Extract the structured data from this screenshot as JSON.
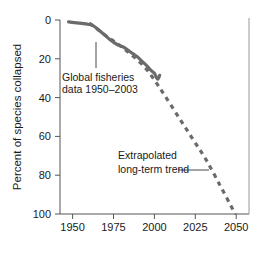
{
  "figure": {
    "background": "#ffffff",
    "line_color": "#6b6b6b",
    "axis_color": "#555555",
    "text_color": "#1a1a1a"
  },
  "chart_data": {
    "type": "line",
    "title": "",
    "xlabel": "",
    "ylabel": "Percent of species collapsed",
    "xlim": [
      1945,
      2055
    ],
    "ylim": [
      0,
      100
    ],
    "y_inverted": true,
    "grid": false,
    "legend": "none",
    "xticks": [
      1950,
      1975,
      2000,
      2025,
      2050
    ],
    "xtick_labels": [
      "1950",
      "1975",
      "2000",
      "2025",
      "2050"
    ],
    "yticks": [
      0,
      20,
      40,
      60,
      80,
      100
    ],
    "ytick_labels": [
      "0",
      "20",
      "40",
      "60",
      "80",
      "100"
    ],
    "series": [
      {
        "name": "Global fisheries data 1950-2003",
        "style": "solid",
        "color": "#6b6b6b",
        "x": [
          1950,
          1955,
          1960,
          1963,
          1966,
          1970,
          1974,
          1978,
          1982,
          1986,
          1990,
          1993,
          1996,
          1998,
          2000,
          2001,
          2002,
          2003
        ],
        "y": [
          1,
          1.5,
          2,
          2.5,
          4,
          7,
          10,
          12.5,
          14,
          16.5,
          19,
          21.5,
          24,
          26,
          27.5,
          29.5,
          30.5,
          28.5
        ]
      },
      {
        "name": "Extrapolated long-term trend",
        "style": "dashed",
        "color": "#6b6b6b",
        "x": [
          1962,
          1970,
          1978,
          1986,
          1994,
          2000,
          2006,
          2014,
          2022,
          2030,
          2038,
          2044,
          2047
        ],
        "y": [
          1.5,
          7,
          12,
          17.5,
          24,
          31,
          39,
          50,
          61,
          72,
          85,
          95,
          100
        ]
      }
    ],
    "annotations": [
      {
        "text_line_1": "Global fisheries",
        "text_line_2": "data 1950–2003",
        "x": 1968,
        "y": 27,
        "leader": "vertical-up"
      },
      {
        "text_line_1": "Extrapolated",
        "text_line_2": "long-term trend",
        "x": 2012,
        "y": 70,
        "leader": "horizontal-right"
      }
    ]
  }
}
